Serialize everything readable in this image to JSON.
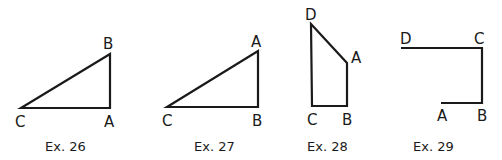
{
  "figures": [
    {
      "caption": "Ex. 26",
      "type": "triangle",
      "closed": true,
      "vertices": [
        {
          "label": "C"
        },
        {
          "label": "B"
        },
        {
          "label": "A"
        }
      ]
    },
    {
      "caption": "Ex. 27",
      "type": "triangle",
      "closed": true,
      "vertices": [
        {
          "label": "C"
        },
        {
          "label": "A"
        },
        {
          "label": "B"
        }
      ]
    },
    {
      "caption": "Ex. 28",
      "type": "quadrilateral",
      "closed": true,
      "vertices": [
        {
          "label": "D"
        },
        {
          "label": "A"
        },
        {
          "label": "B"
        },
        {
          "label": "C"
        }
      ]
    },
    {
      "caption": "Ex. 29",
      "type": "polyline",
      "closed": false,
      "vertices": [
        {
          "label": "D"
        },
        {
          "label": "C"
        },
        {
          "label": "B"
        },
        {
          "label": "A"
        }
      ]
    }
  ]
}
